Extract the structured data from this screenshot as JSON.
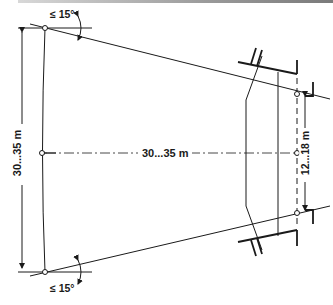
{
  "figure": {
    "type": "headlight beam alignment diagram",
    "labels": {
      "angle_top": "≤ 15°",
      "angle_bottom": "≤ 15°",
      "lateral_distance": "30...35 m",
      "longitudinal_distance": "30...35 m",
      "headlight_spacing": "12...18 m"
    },
    "colors": {
      "line": "#1a1a1a",
      "background": "#ffffff",
      "top_rule": "#9a9a9a"
    }
  }
}
